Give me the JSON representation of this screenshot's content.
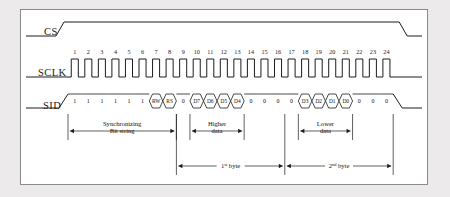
{
  "diagram": {
    "signals": [
      {
        "name": "CS",
        "label": "CS"
      },
      {
        "name": "SCLK",
        "label": "SCLK"
      },
      {
        "name": "SID",
        "label": "SID"
      }
    ],
    "clock": {
      "count": 24,
      "numbers": [
        "1",
        "2",
        "3",
        "4",
        "5",
        "6",
        "7",
        "8",
        "9",
        "10",
        "11",
        "12",
        "13",
        "14",
        "15",
        "16",
        "17",
        "18",
        "19",
        "20",
        "21",
        "22",
        "23",
        "24"
      ]
    },
    "sid_bits": [
      {
        "index": 1,
        "label": "1",
        "type": "level"
      },
      {
        "index": 2,
        "label": "1",
        "type": "level"
      },
      {
        "index": 3,
        "label": "1",
        "type": "level"
      },
      {
        "index": 4,
        "label": "1",
        "type": "level"
      },
      {
        "index": 5,
        "label": "1",
        "type": "level"
      },
      {
        "index": 6,
        "label": "1",
        "type": "level"
      },
      {
        "index": 7,
        "label": "RW",
        "type": "bus"
      },
      {
        "index": 8,
        "label": "RS",
        "type": "bus"
      },
      {
        "index": 9,
        "label": "0",
        "type": "level"
      },
      {
        "index": 10,
        "label": "D7",
        "type": "bus"
      },
      {
        "index": 11,
        "label": "D6",
        "type": "bus"
      },
      {
        "index": 12,
        "label": "D5",
        "type": "bus"
      },
      {
        "index": 13,
        "label": "D4",
        "type": "bus"
      },
      {
        "index": 14,
        "label": "0",
        "type": "level"
      },
      {
        "index": 15,
        "label": "0",
        "type": "level"
      },
      {
        "index": 16,
        "label": "0",
        "type": "level"
      },
      {
        "index": 17,
        "label": "0",
        "type": "level"
      },
      {
        "index": 18,
        "label": "D3",
        "type": "bus"
      },
      {
        "index": 19,
        "label": "D2",
        "type": "bus"
      },
      {
        "index": 20,
        "label": "D1",
        "type": "bus"
      },
      {
        "index": 21,
        "label": "D0",
        "type": "bus"
      },
      {
        "index": 22,
        "label": "0",
        "type": "level"
      },
      {
        "index": 23,
        "label": "0",
        "type": "level"
      },
      {
        "index": 24,
        "label": "0",
        "type": "level"
      }
    ],
    "annotations": {
      "sync": {
        "line1": "Synchronizing",
        "line2": "Bit string"
      },
      "higher": {
        "line1": "Higher",
        "line2": "data"
      },
      "lower": {
        "line1": "Lower",
        "line2": "data"
      },
      "byte1": {
        "text": "1",
        "sup": "st",
        "unit": "byte"
      },
      "byte2": {
        "text": "2",
        "sup": "nd",
        "unit": "byte"
      }
    },
    "colors": {
      "ink": "#1c1c1c",
      "frame": "#8a8a8a",
      "page": "#eceaea",
      "panel": "#ffffff"
    }
  }
}
